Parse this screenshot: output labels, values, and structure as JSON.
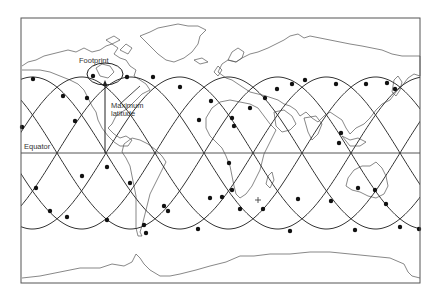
{
  "diagram": {
    "type": "satellite-ground-track-map",
    "frame": {
      "x": 21,
      "y": 18,
      "width": 399,
      "height": 265,
      "stroke": "#555555"
    },
    "equator": {
      "y": 153,
      "label": "Equator"
    },
    "tracks": {
      "count": 6,
      "amplitude_px": 76,
      "period_px": 294,
      "first_equator_crossing_x": 57,
      "spacing_px": 49,
      "stroke": "#333333",
      "max_latitude_y": 77,
      "min_latitude_y": 229
    },
    "footprint": {
      "label": "Footprint",
      "cx": 105,
      "cy": 74,
      "rx": 18,
      "ry": 11
    },
    "max_latitude": {
      "label_line1": "Maximum",
      "label_line2": "latitude",
      "arrow_x": 105,
      "arrow_from_y": 153,
      "arrow_to_y": 80
    },
    "satellite_positions": [
      [
        33,
        79
      ],
      [
        63,
        96
      ],
      [
        75,
        121
      ],
      [
        22,
        127
      ],
      [
        87,
        98
      ],
      [
        127,
        77
      ],
      [
        153,
        77
      ],
      [
        180,
        87
      ],
      [
        211,
        101
      ],
      [
        232,
        118
      ],
      [
        107,
        167
      ],
      [
        130,
        183
      ],
      [
        82,
        176
      ],
      [
        36,
        188
      ],
      [
        50,
        211
      ],
      [
        67,
        217
      ],
      [
        107,
        220
      ],
      [
        144,
        225
      ],
      [
        146,
        233
      ],
      [
        164,
        206
      ],
      [
        168,
        211
      ],
      [
        198,
        229
      ],
      [
        222,
        197
      ],
      [
        232,
        190
      ],
      [
        199,
        120
      ],
      [
        234,
        126
      ],
      [
        250,
        108
      ],
      [
        265,
        98
      ],
      [
        277,
        89
      ],
      [
        292,
        84
      ],
      [
        305,
        80
      ],
      [
        336,
        84
      ],
      [
        366,
        84
      ],
      [
        387,
        83
      ],
      [
        395,
        89
      ],
      [
        339,
        143
      ],
      [
        341,
        133
      ],
      [
        229,
        163
      ],
      [
        210,
        198
      ],
      [
        240,
        209
      ],
      [
        263,
        209
      ],
      [
        298,
        199
      ],
      [
        331,
        201
      ],
      [
        358,
        188
      ],
      [
        375,
        190
      ],
      [
        386,
        204
      ],
      [
        355,
        230
      ],
      [
        290,
        231
      ],
      [
        400,
        227
      ],
      [
        419,
        229
      ]
    ],
    "cross_marker": {
      "x": 258,
      "y": 200
    }
  }
}
